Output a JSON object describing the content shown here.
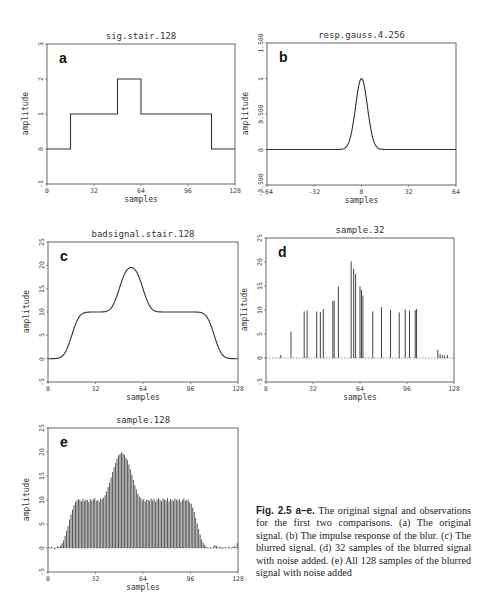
{
  "figure": {
    "caption_label": "Fig. 2.5 a–e.",
    "caption_text": "The original signal and observations for the first two comparisons. (a) The original signal. (b) The impulse response of the blur. (c) The blurred signal. (d) 32 samples of the blurred signal with noise added. (e) All 128 samples of the blurred signal with noise added"
  },
  "chart_data": [
    {
      "id": "a",
      "panel_label": "a",
      "type": "line",
      "title": "sig.stair.128",
      "xlabel": "samples",
      "ylabel": "amplitude",
      "xlim": [
        0,
        128
      ],
      "ylim": [
        -1,
        3
      ],
      "xticks": [
        "0",
        "32",
        "64",
        "96",
        "128"
      ],
      "yticks": [
        "-1",
        "0",
        "1",
        "2",
        "3"
      ],
      "grid": false,
      "box": {
        "left": 47,
        "top": 44,
        "right": 235,
        "bottom": 184
      },
      "x": [
        0,
        16,
        16,
        48,
        48,
        64,
        64,
        112,
        112,
        128
      ],
      "y": [
        0,
        0,
        1,
        1,
        2,
        2,
        1,
        1,
        0,
        0
      ]
    },
    {
      "id": "b",
      "panel_label": "b",
      "type": "line",
      "title": "resp.gauss.4.256",
      "xlabel": "samples",
      "ylabel": "amplitude",
      "xlim": [
        -64,
        64
      ],
      "ylim": [
        -0.5,
        1.5
      ],
      "xticks": [
        "-64",
        "-32",
        "0",
        "32",
        "64"
      ],
      "yticks": [
        "-0.500",
        "0",
        "0.500",
        "1",
        "1.500"
      ],
      "grid": false,
      "box": {
        "left": 267,
        "top": 43,
        "right": 456,
        "bottom": 185
      },
      "gaussian": {
        "center": 0,
        "sigma": 4,
        "peak": 1
      }
    },
    {
      "id": "c",
      "panel_label": "c",
      "type": "line",
      "title": "badsignal.stair.128",
      "xlabel": "samples",
      "ylabel": "amplitude",
      "xlim": [
        0,
        128
      ],
      "ylim": [
        -5,
        25
      ],
      "xticks": [
        "0",
        "32",
        "64",
        "96",
        "128"
      ],
      "yticks": [
        "-5",
        "0",
        "5",
        "10",
        "15",
        "20",
        "25"
      ],
      "grid": false,
      "box": {
        "left": 48,
        "top": 242,
        "right": 238,
        "bottom": 382
      },
      "model": {
        "description": "stair signal (levels 0,10,20,10,0) blurred by gaussian sigma 4",
        "steps": [
          [
            0,
            16,
            0
          ],
          [
            16,
            48,
            10
          ],
          [
            48,
            64,
            20
          ],
          [
            64,
            112,
            10
          ],
          [
            112,
            128,
            0
          ]
        ],
        "sigma": 4
      }
    },
    {
      "id": "d",
      "panel_label": "d",
      "type": "stem",
      "title": "sample.32",
      "xlabel": "samples",
      "ylabel": "amplitude",
      "xlim": [
        0,
        128
      ],
      "ylim": [
        -5,
        25
      ],
      "xticks": [
        "0",
        "32",
        "64",
        "96",
        "128"
      ],
      "yticks": [
        "-5",
        "0",
        "5",
        "10",
        "15",
        "20",
        "25"
      ],
      "grid": false,
      "baseline": "dashed",
      "box": {
        "left": 266,
        "top": 238,
        "right": 454,
        "bottom": 382
      },
      "x": [
        10,
        17,
        26,
        28,
        34.5,
        37,
        39,
        45.5,
        46.4,
        49.3,
        58,
        59.7,
        61,
        64,
        65,
        66,
        72.7,
        78.6,
        84.8,
        90.7,
        94.8,
        97.7,
        101.6,
        102.5,
        117,
        118.5,
        120,
        121.6,
        123.6
      ],
      "values": [
        0.6,
        5.5,
        9.7,
        9.9,
        9.7,
        9.6,
        10.2,
        11.9,
        11.9,
        14.9,
        20.1,
        18.6,
        17.5,
        14.9,
        14.2,
        13.0,
        9.7,
        10.6,
        10.0,
        9.5,
        10.1,
        9.9,
        10.0,
        10.2,
        1.7,
        0.8,
        0.6,
        0.5,
        0.6
      ]
    },
    {
      "id": "e",
      "panel_label": "e",
      "type": "stem",
      "title": "sample.128",
      "xlabel": "samples",
      "ylabel": "amplitude",
      "xlim": [
        0,
        128
      ],
      "ylim": [
        -5,
        25
      ],
      "xticks": [
        "0",
        "32",
        "64",
        "96",
        "128"
      ],
      "yticks": [
        "-5",
        "0",
        "5",
        "10",
        "15",
        "20",
        "25"
      ],
      "grid": false,
      "baseline": "dashed",
      "box": {
        "left": 48,
        "top": 428,
        "right": 238,
        "bottom": 572
      },
      "values": [
        0.2,
        -0.1,
        0.3,
        0.0,
        -0.3,
        0.1,
        0.4,
        0.2,
        0.6,
        1.0,
        1.6,
        2.5,
        3.6,
        4.6,
        5.9,
        7.0,
        8.0,
        8.9,
        9.6,
        9.9,
        10.2,
        10.0,
        9.7,
        10.3,
        9.8,
        10.1,
        10.0,
        9.6,
        10.2,
        9.9,
        10.1,
        10.4,
        9.8,
        10.0,
        9.7,
        10.3,
        10.2,
        10.5,
        11.0,
        11.8,
        12.7,
        13.6,
        14.7,
        15.8,
        16.8,
        17.7,
        18.6,
        19.3,
        19.6,
        19.9,
        19.7,
        19.4,
        18.8,
        18.3,
        17.4,
        16.4,
        15.3,
        14.2,
        13.1,
        12.2,
        11.3,
        10.7,
        10.4,
        9.9,
        10.2,
        9.7,
        10.1,
        10.0,
        9.8,
        10.3,
        9.9,
        10.2,
        9.6,
        10.1,
        10.4,
        10.0,
        9.8,
        10.3,
        10.1,
        9.9,
        10.4,
        9.7,
        10.2,
        10.0,
        9.8,
        10.3,
        10.1,
        9.9,
        10.2,
        9.6,
        10.0,
        10.3,
        9.8,
        10.1,
        9.9,
        9.5,
        9.2,
        8.4,
        7.5,
        6.3,
        5.1,
        3.9,
        2.8,
        1.8,
        1.1,
        0.6,
        0.3,
        0.1,
        -0.1,
        0.2,
        0.0,
        0.3,
        0.6,
        0.4,
        0.2,
        0.1,
        0.3,
        -0.2,
        0.1,
        0.2,
        0.0,
        0.3,
        0.1,
        -0.1,
        0.2,
        0.4,
        0.2,
        1.0
      ]
    }
  ]
}
